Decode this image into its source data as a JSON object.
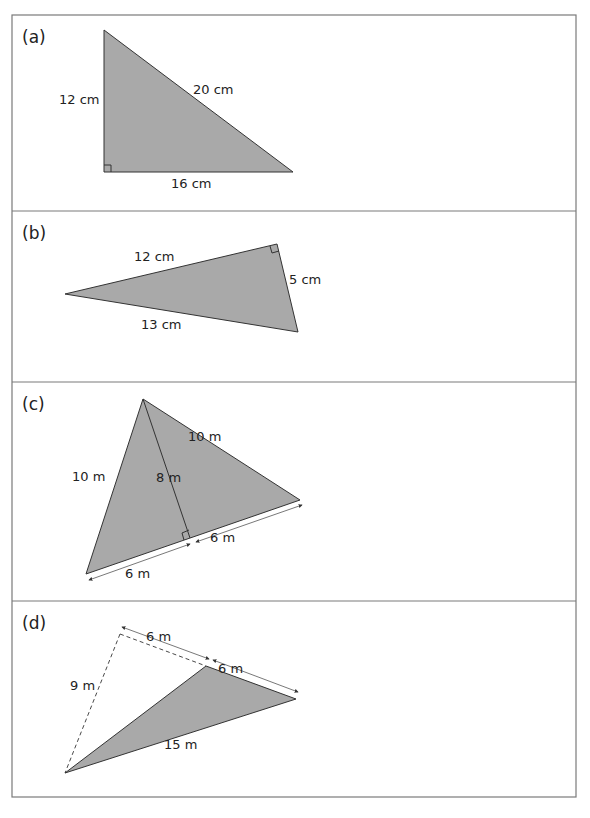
{
  "colors": {
    "fill": "#a9a9a9",
    "stroke": "#333333",
    "frame": "#7a7a7a",
    "dim": "#555555"
  },
  "panels": [
    {
      "id": "a",
      "label": "(a)",
      "sides": [
        "12 cm",
        "20 cm",
        "16 cm"
      ]
    },
    {
      "id": "b",
      "label": "(b)",
      "sides": [
        "12 cm",
        "5 cm",
        "13 cm"
      ]
    },
    {
      "id": "c",
      "label": "(c)",
      "sides": [
        "10 m",
        "10 m",
        "8 m",
        "6 m",
        "6 m"
      ]
    },
    {
      "id": "d",
      "label": "(d)",
      "sides": [
        "6 m",
        "6 m",
        "9 m",
        "15 m"
      ]
    }
  ]
}
